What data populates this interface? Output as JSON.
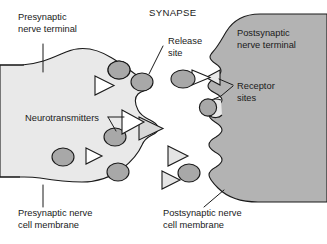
{
  "figure": {
    "title": "SYNAPSE",
    "type": "biological-diagram"
  },
  "labels": {
    "presynaptic_terminal": {
      "line1": "Presynaptic",
      "line2": "nerve terminal"
    },
    "release_site": {
      "line1": "Release",
      "line2": "site"
    },
    "postsynaptic_terminal": {
      "line1": "Postsynaptic",
      "line2": "nerve terminal"
    },
    "receptor_sites": {
      "line1": "Receptor",
      "line2": "sites"
    },
    "neurotransmitters": {
      "line1": "Neurotransmitters"
    },
    "presynaptic_membrane": {
      "line1": "Presynaptic nerve",
      "line2": "cell membrane"
    },
    "postsynaptic_membrane": {
      "line1": "Postsynaptic nerve",
      "line2": "cell membrane"
    }
  },
  "colors": {
    "background": "#ffffff",
    "presynaptic_fill": "#e9e9e9",
    "postsynaptic_fill": "#b3b3b3",
    "vesicle_fill": "#a8a8a8",
    "neurotransmitter_fill": "#d8d8d8",
    "cleft_neurotransmitter_fill": "#e4e4e4",
    "outline": "#1a1a1a",
    "text": "#1a1a1a"
  },
  "elements": {
    "vesicles_in_terminal": 5,
    "vesicles_in_cleft": 2,
    "neurotransmitters_in_terminal": 4,
    "neurotransmitters_in_cleft": 2,
    "docked_at_receptor": 2,
    "release_sites": 2,
    "receptor_notches": 2
  }
}
